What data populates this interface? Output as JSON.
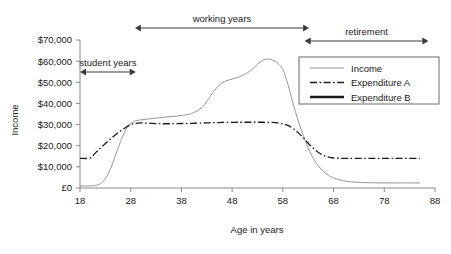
{
  "chart_data": {
    "type": "line",
    "title": "",
    "xlabel": "Age in years",
    "ylabel": "Income",
    "xlim": [
      18,
      88
    ],
    "ylim": [
      0,
      70000
    ],
    "grid": false,
    "legend_position": "right-upper-inside",
    "xticks": [
      18,
      28,
      38,
      48,
      58,
      68,
      78,
      88
    ],
    "xtick_labels": [
      "18",
      "28",
      "38",
      "48",
      "58",
      "68",
      "78",
      "88"
    ],
    "yticks": [
      0,
      10000,
      20000,
      30000,
      40000,
      50000,
      60000,
      70000
    ],
    "ytick_labels": [
      "£0",
      "$10,000",
      "$20,000",
      "$30,000",
      "$40,000",
      "$50,000",
      "$60,000",
      "$70,000"
    ],
    "x": [
      18,
      20,
      21,
      22,
      23,
      24,
      25,
      26,
      27,
      28,
      29,
      30,
      31,
      32,
      34,
      36,
      38,
      40,
      42,
      43,
      44,
      45,
      46,
      47,
      48,
      49,
      50,
      51,
      52,
      53,
      54,
      55,
      56,
      57,
      58,
      59,
      60,
      61,
      62,
      63,
      64,
      65,
      66,
      67,
      68,
      70,
      72,
      75,
      80,
      85
    ],
    "series": [
      {
        "name": "Income",
        "style": "thin-solid",
        "color": "#8a8a8a",
        "values": [
          1000,
          1000,
          1200,
          2000,
          4500,
          9000,
          15500,
          22000,
          27500,
          30500,
          31800,
          32200,
          32500,
          32800,
          33300,
          33800,
          34300,
          35200,
          38000,
          41000,
          44500,
          47500,
          49800,
          50800,
          51500,
          52200,
          53200,
          54500,
          56200,
          58500,
          60400,
          61000,
          60500,
          59000,
          56000,
          49000,
          40000,
          32000,
          25000,
          19000,
          14000,
          10500,
          7800,
          6000,
          4800,
          3400,
          2800,
          2500,
          2400,
          2400
        ]
      },
      {
        "name": "Expenditure A",
        "style": "dash-dot",
        "color": "#1a1a1a",
        "values": [
          14000,
          14200,
          16500,
          18800,
          21000,
          23200,
          25200,
          27000,
          28600,
          29900,
          30600,
          30800,
          30700,
          30600,
          30400,
          30400,
          30500,
          30600,
          30700,
          30800,
          30900,
          30900,
          31000,
          31000,
          31000,
          31100,
          31100,
          31100,
          31100,
          31100,
          31100,
          31050,
          31000,
          30800,
          30400,
          29600,
          28200,
          26200,
          23800,
          21200,
          18800,
          16800,
          15400,
          14600,
          14200,
          14000,
          14000,
          14000,
          14000,
          14000
        ]
      },
      {
        "name": "Expenditure B",
        "style": "thick-solid",
        "color": "#7a2b2b",
        "color_right": "#1f3864",
        "values": [
          23200,
          23200,
          23200,
          23200,
          23200,
          23200,
          23200,
          23200,
          23200,
          23200,
          23200,
          23200,
          23200,
          23200,
          23200,
          23200,
          23200,
          23200,
          23200,
          23200,
          23200,
          23200,
          23200,
          23200,
          23200,
          23200,
          23200,
          23200,
          23200,
          23200,
          23200,
          23200,
          23200,
          23200,
          23200,
          23200,
          23200,
          23200,
          23200,
          23200,
          23200,
          23200,
          23200,
          23200,
          23200,
          23200,
          23200,
          23200,
          23200,
          23200
        ]
      }
    ],
    "annotations": [
      {
        "label": "student years",
        "x_start": 19.2,
        "x_end": 27.8,
        "row": 2
      },
      {
        "label": "working years",
        "x_start": 30.0,
        "x_end": 62.0,
        "row": 0
      },
      {
        "label": "retirement",
        "x_start": 63.5,
        "x_end": 85.5,
        "row": 1
      }
    ]
  },
  "legend": {
    "items": [
      {
        "label": "Income"
      },
      {
        "label": "Expenditure A"
      },
      {
        "label": "Expenditure B"
      }
    ]
  },
  "colors": {
    "axis": "#8a8a8a",
    "text": "#1a1a1a",
    "income": "#8a8a8a",
    "expenditure_a": "#1a1a1a",
    "expenditure_b_left": "#7a2b2b",
    "expenditure_b_right": "#1f3864",
    "annotation": "#3a3a3a",
    "background": "#ffffff"
  }
}
